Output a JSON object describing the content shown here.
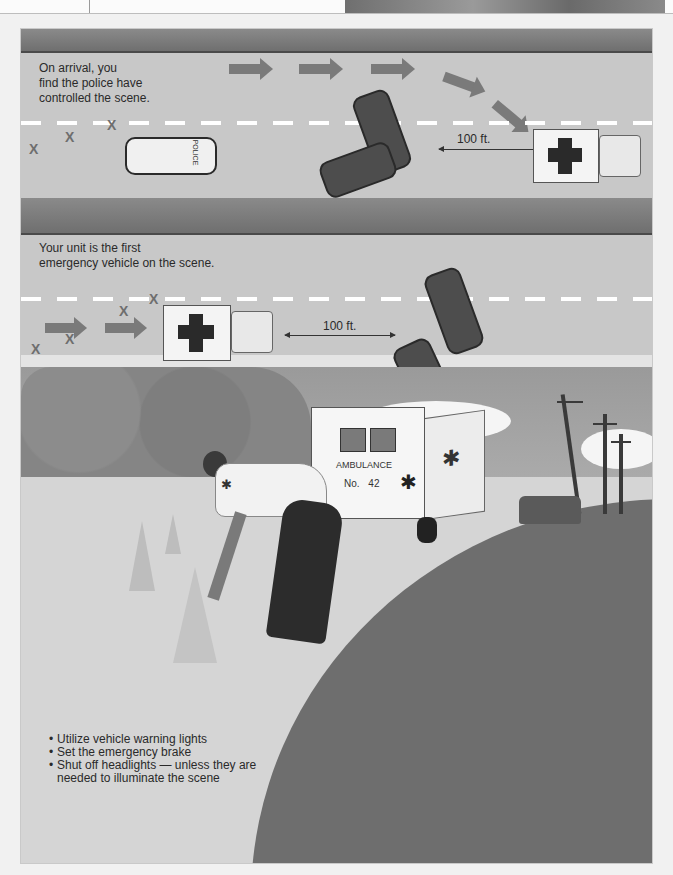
{
  "figure": {
    "panel_1": {
      "caption": [
        "On arrival, you",
        "find the police have",
        "controlled the scene."
      ],
      "distance_label": "100 ft.",
      "police_car_label": "POLICE",
      "hazard_marks": [
        "X",
        "X",
        "X"
      ]
    },
    "panel_2": {
      "caption": [
        "Your unit is the first",
        "emergency vehicle on the scene."
      ],
      "distance_label": "100 ft.",
      "hazard_marks": [
        "X",
        "X",
        "X",
        "X",
        "X"
      ]
    },
    "panel_3": {
      "ambulance_label": "AMBULANCE",
      "ambulance_number_prefix": "No.",
      "ambulance_number": "42",
      "bullets": [
        "Utilize vehicle warning lights",
        "Set the emergency brake",
        "Shut off headlights — unless they are needed to illuminate the scene"
      ]
    },
    "icons": [
      "star-of-life-icon",
      "medical-cross-icon",
      "arrow-right-icon"
    ],
    "colors": {
      "shoulder": "#787878",
      "road": "#c8c8c8",
      "lane_dash": "#ffffff",
      "text": "#2a2a2a",
      "background": "#f1f1f1"
    }
  }
}
